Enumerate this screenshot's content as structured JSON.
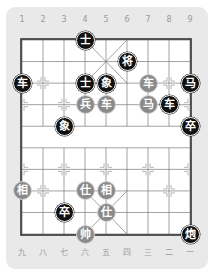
{
  "board": {
    "top_file_labels": [
      "1",
      "2",
      "3",
      "4",
      "5",
      "6",
      "7",
      "8",
      "9"
    ],
    "bottom_file_labels": [
      "九",
      "八",
      "七",
      "六",
      "五",
      "四",
      "三",
      "二",
      "一"
    ],
    "colors": {
      "frame_bg": "#e9e9e9",
      "board_bg": "#ffffff",
      "line": "#555555",
      "black_piece": "#111111",
      "red_piece_rendered": "#8a8a8a"
    }
  },
  "pieces": [
    {
      "side": "black",
      "char": "士",
      "col": 3,
      "row": 0,
      "name": "black-advisor"
    },
    {
      "side": "black",
      "char": "将",
      "col": 5,
      "row": 1,
      "name": "black-general"
    },
    {
      "side": "black",
      "char": "车",
      "col": 0,
      "row": 2,
      "name": "black-chariot"
    },
    {
      "side": "black",
      "char": "士",
      "col": 3,
      "row": 2,
      "name": "black-advisor"
    },
    {
      "side": "black",
      "char": "象",
      "col": 4,
      "row": 2,
      "name": "black-elephant"
    },
    {
      "side": "red",
      "char": "车",
      "col": 6,
      "row": 2,
      "name": "red-chariot"
    },
    {
      "side": "black",
      "char": "马",
      "col": 8,
      "row": 2,
      "name": "black-horse"
    },
    {
      "side": "red",
      "char": "兵",
      "col": 3,
      "row": 3,
      "name": "red-soldier"
    },
    {
      "side": "red",
      "char": "车",
      "col": 4,
      "row": 3,
      "name": "red-chariot"
    },
    {
      "side": "red",
      "char": "马",
      "col": 6,
      "row": 3,
      "name": "red-horse"
    },
    {
      "side": "black",
      "char": "车",
      "col": 7,
      "row": 3,
      "name": "black-chariot"
    },
    {
      "side": "black",
      "char": "象",
      "col": 2,
      "row": 4,
      "name": "black-elephant"
    },
    {
      "side": "black",
      "char": "卒",
      "col": 8,
      "row": 4,
      "name": "black-soldier"
    },
    {
      "side": "red",
      "char": "相",
      "col": 0,
      "row": 7,
      "name": "red-elephant"
    },
    {
      "side": "red",
      "char": "仕",
      "col": 3,
      "row": 7,
      "name": "red-advisor"
    },
    {
      "side": "red",
      "char": "相",
      "col": 4,
      "row": 7,
      "name": "red-elephant"
    },
    {
      "side": "black",
      "char": "卒",
      "col": 2,
      "row": 8,
      "name": "black-soldier"
    },
    {
      "side": "red",
      "char": "仕",
      "col": 4,
      "row": 8,
      "name": "red-advisor"
    },
    {
      "side": "red",
      "char": "帅",
      "col": 3,
      "row": 9,
      "name": "red-general"
    },
    {
      "side": "black",
      "char": "炮",
      "col": 8,
      "row": 9,
      "name": "black-cannon"
    }
  ]
}
